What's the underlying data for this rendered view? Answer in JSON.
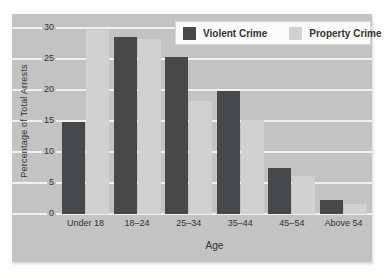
{
  "chart_data": {
    "type": "bar",
    "title": "",
    "categories": [
      "Under 18",
      "18–24",
      "25–34",
      "35–44",
      "45–54",
      "Above 54"
    ],
    "series": [
      {
        "name": "Violent Crime",
        "color": "#474849",
        "values": [
          14.9,
          28.5,
          25.3,
          19.8,
          7.5,
          2.3
        ]
      },
      {
        "name": "Property Crime",
        "color": "#d0d1d0",
        "values": [
          29.7,
          28.2,
          18.3,
          15.2,
          6.1,
          1.6
        ]
      }
    ],
    "xlabel": "Age",
    "ylabel": "Percentage of Total Arrests",
    "ylim": [
      0,
      30
    ],
    "yticks": [
      0,
      5,
      10,
      15,
      20,
      25,
      30
    ],
    "grid": true,
    "legend_position": "top-right",
    "colors": {
      "plot_background": "#c2c3c2",
      "gridline": "#f0f0ee",
      "text": "#333433",
      "legend_background": "#fafaf9",
      "legend_border": "#d8d8d7"
    }
  }
}
